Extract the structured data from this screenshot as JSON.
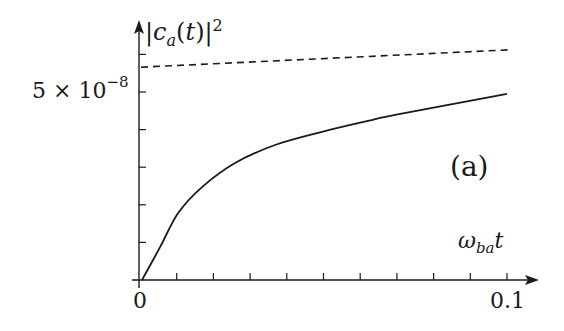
{
  "chart_data": {
    "type": "line",
    "title": "",
    "panel_label": "(a)",
    "xlabel": "ω_ba t",
    "ylabel": "|c_a(t)|^2",
    "xlim": [
      0,
      0.105
    ],
    "ylim": [
      0,
      6.5e-08
    ],
    "grid": false,
    "legend": null,
    "x_tick_labels": [
      "0",
      "0.1"
    ],
    "x_ticks": [
      0,
      0.01,
      0.02,
      0.03,
      0.04,
      0.05,
      0.06,
      0.07,
      0.08,
      0.09,
      0.1
    ],
    "y_tick_labels": [
      "5 × 10^-8"
    ],
    "y_ticks": [
      1e-08,
      2e-08,
      3e-08,
      4e-08,
      5e-08,
      6e-08
    ],
    "series": [
      {
        "name": "exact (solid)",
        "style": "solid",
        "x": [
          0,
          0.0055,
          0.0104,
          0.0169,
          0.0259,
          0.0368,
          0.0496,
          0.0621,
          0.0695,
          0.1
        ],
        "values": [
          0,
          8.8e-09,
          1.78e-08,
          2.47e-08,
          3.11e-08,
          3.59e-08,
          3.94e-08,
          4.23e-08,
          4.39e-08,
          4.95e-08
        ]
      },
      {
        "name": "asymptotic (dashed)",
        "style": "dashed",
        "x": [
          0,
          0.1
        ],
        "values": [
          5.66e-08,
          6.12e-08
        ]
      }
    ]
  },
  "labels": {
    "ylabel_pre": "|",
    "ylabel_c": "c",
    "ylabel_sub": "a",
    "ylabel_mid": "(",
    "ylabel_t": "t",
    "ylabel_post": ")|",
    "ylabel_sup": "2",
    "ytick_main": "5 × 10",
    "ytick_exp": "−8",
    "xlabel_omega": "ω",
    "xlabel_sub": "ba",
    "xlabel_t": "t",
    "xtick_0": "0",
    "xtick_1": "0.1",
    "panel": "(a)"
  },
  "colors": {
    "ink": "#1a1a1a",
    "background": "#ffffff"
  }
}
